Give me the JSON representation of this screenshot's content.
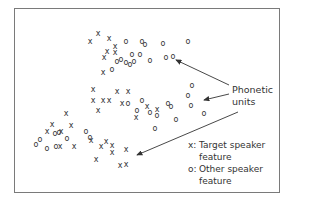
{
  "annotation": {
    "label_line1": "Phonetic",
    "label_line2": "units"
  },
  "legend": [
    {
      "symbol": "x:",
      "text": "Target speaker\nfeature"
    },
    {
      "symbol": "o:",
      "text": "Other speaker\nfeature"
    }
  ],
  "points": {
    "x": [
      [
        90,
        41
      ],
      [
        98,
        33
      ],
      [
        109,
        38
      ],
      [
        115,
        46
      ],
      [
        115,
        52
      ],
      [
        107,
        51
      ],
      [
        104,
        57
      ],
      [
        103,
        72
      ],
      [
        93,
        89
      ],
      [
        93,
        100
      ],
      [
        103,
        100
      ],
      [
        109,
        100
      ],
      [
        98,
        110
      ],
      [
        117,
        91
      ],
      [
        128,
        91
      ],
      [
        122,
        103
      ],
      [
        147,
        106
      ],
      [
        136,
        117
      ],
      [
        157,
        109
      ],
      [
        66,
        113
      ],
      [
        71,
        125
      ],
      [
        52,
        124
      ],
      [
        47,
        131
      ],
      [
        61,
        131
      ],
      [
        60,
        146
      ],
      [
        74,
        146
      ],
      [
        91,
        140
      ],
      [
        101,
        146
      ],
      [
        106,
        141
      ],
      [
        112,
        145
      ],
      [
        112,
        152
      ],
      [
        126,
        149
      ],
      [
        96,
        159
      ],
      [
        120,
        165
      ],
      [
        126,
        164
      ]
    ],
    "o": [
      [
        126,
        41
      ],
      [
        142,
        41
      ],
      [
        145,
        44
      ],
      [
        163,
        43
      ],
      [
        188,
        41
      ],
      [
        132,
        54
      ],
      [
        140,
        54
      ],
      [
        150,
        60
      ],
      [
        166,
        57
      ],
      [
        173,
        56
      ],
      [
        117,
        61
      ],
      [
        121,
        59
      ],
      [
        126,
        62
      ],
      [
        130,
        64
      ],
      [
        134,
        61
      ],
      [
        112,
        69
      ],
      [
        192,
        85
      ],
      [
        188,
        95
      ],
      [
        191,
        105
      ],
      [
        204,
        113
      ],
      [
        128,
        103
      ],
      [
        142,
        100
      ],
      [
        137,
        110
      ],
      [
        150,
        112
      ],
      [
        157,
        115
      ],
      [
        168,
        103
      ],
      [
        171,
        106
      ],
      [
        176,
        119
      ],
      [
        155,
        128
      ],
      [
        40,
        139
      ],
      [
        36,
        144
      ],
      [
        55,
        133
      ],
      [
        59,
        132
      ],
      [
        56,
        146
      ],
      [
        67,
        138
      ],
      [
        86,
        131
      ],
      [
        90,
        137
      ],
      [
        47,
        148
      ]
    ]
  }
}
